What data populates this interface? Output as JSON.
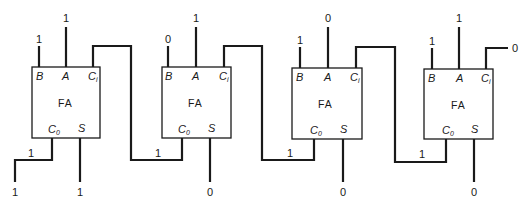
{
  "diagram": {
    "block_label": "FA",
    "pin_labels": {
      "b": "B",
      "a": "A",
      "ci": "C",
      "ci_sub": "i",
      "co": "C",
      "co_sub": "0",
      "s": "S"
    },
    "adders": [
      {
        "id": "fa1",
        "inputs": {
          "B": "1",
          "A": "1"
        },
        "carry_out": "1",
        "sum": "1",
        "final_carry_out": "1"
      },
      {
        "id": "fa2",
        "inputs": {
          "B": "0",
          "A": "1"
        },
        "carry_out": "1",
        "sum": "0"
      },
      {
        "id": "fa3",
        "inputs": {
          "B": "1",
          "A": "0"
        },
        "carry_out": "1",
        "sum": "0"
      },
      {
        "id": "fa4",
        "inputs": {
          "B": "1",
          "A": "1"
        },
        "carry_in": "0",
        "carry_out": "1",
        "sum": "0"
      }
    ]
  }
}
